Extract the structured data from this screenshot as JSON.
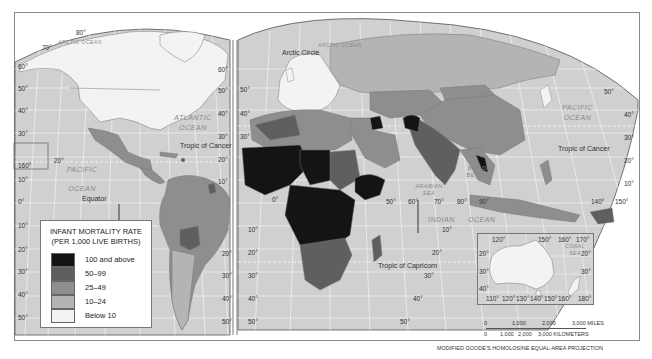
{
  "map": {
    "title": "INFANT MORTALITY RATE",
    "subtitle": "(PER 1,000 LIVE BIRTHS)",
    "projection": "MODIFIED GOODE'S HOMOLOSINE EQUAL-AREA PROJECTION",
    "colors": {
      "ocean": "#d0d0d0",
      "gridline": "#f2f2f2",
      "border": "#777777",
      "c100_plus": "#141414",
      "c50_99": "#5f5f5f",
      "c25_49": "#8e8e8e",
      "c10_24": "#b4b4b4",
      "below10": "#f3f3f3"
    }
  },
  "legend": {
    "title": "INFANT MORTALITY RATE",
    "subtitle": "(PER 1,000 LIVE BIRTHS)",
    "items": [
      {
        "label": "100 and above",
        "color": "#141414"
      },
      {
        "label": "50–99",
        "color": "#5f5f5f"
      },
      {
        "label": "25–49",
        "color": "#8e8e8e"
      },
      {
        "label": "10–24",
        "color": "#b4b4b4"
      },
      {
        "label": "Below 10",
        "color": "#f3f3f3"
      }
    ]
  },
  "labels": {
    "arctic_ocean_left": "ARCTIC OCEAN",
    "arctic_ocean_right": "ARCTIC OCEAN",
    "arctic_circle": "Arctic Circle",
    "atlantic_ocean": "ATLANTIC OCEAN",
    "pacific_ocean_left": "PACIFIC OCEAN",
    "pacific_ocean_right": "PACIFIC OCEAN",
    "indian_ocean_1": "INDIAN",
    "indian_ocean_2": "OCEAN",
    "arabian_sea": "ARABIAN SEA",
    "bay_of_bengal": "BAY OF BENGAL",
    "coral_sea": "CORAL SEA",
    "tropic_of_cancer_left": "Tropic of Cancer",
    "tropic_of_cancer_right": "Tropic of Cancer",
    "tropic_of_capricorn": "Tropic of Capricorn",
    "equator": "Equator"
  },
  "graticule": {
    "left_lat": [
      "60°",
      "50°",
      "40°",
      "30°",
      "20°",
      "10°",
      "0°",
      "10°",
      "20°",
      "30°",
      "40°",
      "50°"
    ],
    "left_inner_lat": [
      "60°",
      "50°",
      "40°",
      "30°",
      "20°",
      "10°"
    ],
    "mid_lat": [
      "50°",
      "40°",
      "30°",
      "20°",
      "30°",
      "40°",
      "50°"
    ],
    "south_america_right_lat": [
      "20°",
      "30°",
      "40°",
      "50°"
    ],
    "africa_left_lat": [
      "10°",
      "20°",
      "30°",
      "40°",
      "50°"
    ],
    "right_lat": [
      "50°",
      "40°",
      "30°",
      "20°",
      "10°"
    ],
    "africa_right_lat": [
      "10°",
      "20°",
      "30°",
      "40°",
      "50°"
    ],
    "polar": [
      "80°",
      "70°"
    ],
    "hawaii_lon": "160°",
    "hawaii_lat": "20°",
    "longitudes_mid": [
      "0°",
      "50°",
      "60°",
      "70°",
      "80°",
      "90°",
      "140°",
      "150°"
    ],
    "inset_top_lon": [
      "120°",
      "150°",
      "160°",
      "170°"
    ],
    "inset_bottom_lon": [
      "110°",
      "120°",
      "130°",
      "140°",
      "150°",
      "160°",
      "180°"
    ],
    "inset_lat_left": [
      "20°",
      "30°",
      "40°"
    ],
    "inset_lat_right": [
      "20°",
      "30°"
    ]
  },
  "scale": {
    "miles": [
      "0",
      "1,000",
      "2,000",
      "3,000 MILES"
    ],
    "km": [
      "0",
      "1,000",
      "2,000",
      "3,000 KILOMETERS"
    ]
  }
}
